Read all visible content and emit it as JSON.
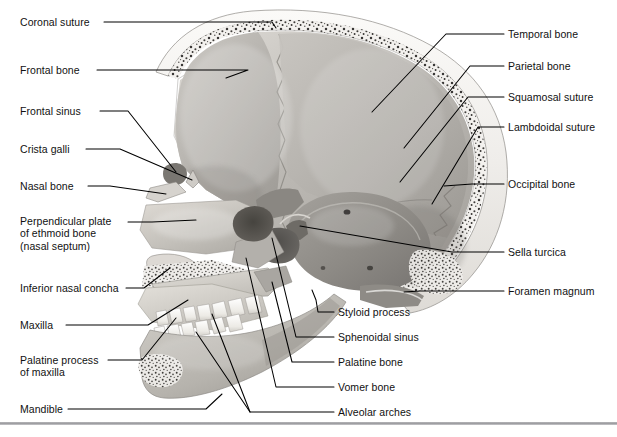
{
  "figure": {
    "width": 617,
    "height": 437,
    "background_color": "#ffffff",
    "illustration_name": "midsagittal-skull-section",
    "rule_color": "#9a9a9e"
  },
  "labels_left": [
    {
      "id": "coronal-suture",
      "text": "Coronal suture",
      "x": 20,
      "y": 16,
      "lines": 1
    },
    {
      "id": "frontal-bone",
      "text": "Frontal bone",
      "x": 20,
      "y": 64,
      "lines": 1
    },
    {
      "id": "frontal-sinus",
      "text": "Frontal sinus",
      "x": 20,
      "y": 105,
      "lines": 1
    },
    {
      "id": "crista-galli",
      "text": "Crista galli",
      "x": 20,
      "y": 143,
      "lines": 1
    },
    {
      "id": "nasal-bone",
      "text": "Nasal bone",
      "x": 20,
      "y": 180,
      "lines": 1
    },
    {
      "id": "perpendicular-plate",
      "text": "Perpendicular plate\nof ethmoid bone\n(nasal septum)",
      "x": 20,
      "y": 215,
      "lines": 3
    },
    {
      "id": "inferior-nasal-concha",
      "text": "Inferior nasal concha",
      "x": 20,
      "y": 282,
      "lines": 1
    },
    {
      "id": "maxilla",
      "text": "Maxilla",
      "x": 20,
      "y": 319,
      "lines": 1
    },
    {
      "id": "palatine-process",
      "text": "Palatine process\nof maxilla",
      "x": 20,
      "y": 354,
      "lines": 2
    },
    {
      "id": "mandible",
      "text": "Mandible",
      "x": 20,
      "y": 403,
      "lines": 1
    }
  ],
  "labels_right": [
    {
      "id": "temporal-bone",
      "text": "Temporal bone",
      "x": 508,
      "y": 28
    },
    {
      "id": "parietal-bone",
      "text": "Parietal bone",
      "x": 508,
      "y": 60
    },
    {
      "id": "squamosal-suture",
      "text": "Squamosal suture",
      "x": 508,
      "y": 91
    },
    {
      "id": "lambdoidal-suture",
      "text": "Lambdoidal suture",
      "x": 508,
      "y": 121
    },
    {
      "id": "occipital-bone",
      "text": "Occipital bone",
      "x": 508,
      "y": 178
    },
    {
      "id": "sella-turcica",
      "text": "Sella turcica",
      "x": 508,
      "y": 246
    },
    {
      "id": "foramen-magnum",
      "text": "Foramen magnum",
      "x": 508,
      "y": 285
    }
  ],
  "labels_bottom": [
    {
      "id": "styloid-process",
      "text": "Styloid process",
      "x": 338,
      "y": 306
    },
    {
      "id": "sphenoidal-sinus",
      "text": "Sphenoidal sinus",
      "x": 338,
      "y": 331
    },
    {
      "id": "palatine-bone",
      "text": "Palatine bone",
      "x": 338,
      "y": 356
    },
    {
      "id": "vomer-bone",
      "text": "Vomer bone",
      "x": 338,
      "y": 381
    },
    {
      "id": "alveolar-arches",
      "text": "Alveolar arches",
      "x": 338,
      "y": 406
    }
  ],
  "colors": {
    "text": "#111111",
    "leader_line": "#000000",
    "bone_light": "#e8e6e1",
    "bone_mid": "#c9c6c0",
    "bone_dark": "#9e9b95",
    "cavity_dark": "#6e6b66",
    "cranial_vault": "#b5b2ad",
    "diploe_speckle": "#3c3a37",
    "tooth": "#f4f2ee"
  }
}
